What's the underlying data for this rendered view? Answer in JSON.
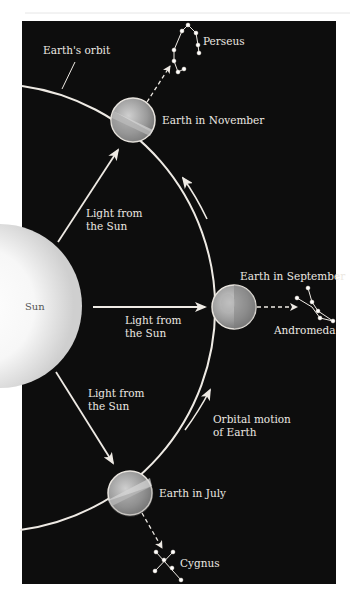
{
  "diagram": {
    "background_color": "#0d0d0d",
    "line_color": "#eeeae4",
    "labels": {
      "earths_orbit": "Earth's orbit",
      "sun": "Sun",
      "perseus": "Perseus",
      "andromeda": "Andromeda",
      "cygnus": "Cygnus",
      "earth_november": "Earth in November",
      "earth_september": "Earth in September",
      "earth_july": "Earth in July",
      "light_upper_1": "Light from",
      "light_upper_2": "the Sun",
      "light_middle_1": "Light from",
      "light_middle_2": "the Sun",
      "light_lower_1": "Light from",
      "light_lower_2": "the Sun",
      "orbital_motion_1": "Orbital motion",
      "orbital_motion_2": "of Earth"
    },
    "earths": [
      {
        "name": "November",
        "cx": 133,
        "cy": 120,
        "r": 22
      },
      {
        "name": "September",
        "cx": 234,
        "cy": 307,
        "r": 22
      },
      {
        "name": "July",
        "cx": 130,
        "cy": 493,
        "r": 22
      }
    ],
    "constellations": {
      "perseus": [
        [
          184,
          69
        ],
        [
          178,
          72
        ],
        [
          174,
          61
        ],
        [
          174,
          50
        ],
        [
          182,
          31
        ],
        [
          188,
          25
        ],
        [
          196,
          33
        ],
        [
          198,
          45
        ],
        [
          199,
          53
        ]
      ],
      "andromeda": [
        [
          297,
          298
        ],
        [
          308,
          288
        ],
        [
          312,
          302
        ],
        [
          318,
          311
        ],
        [
          320,
          318
        ],
        [
          333,
          321
        ]
      ],
      "cygnus": [
        [
          156,
          552
        ],
        [
          173,
          552
        ],
        [
          164,
          560
        ],
        [
          155,
          571
        ],
        [
          172,
          568
        ],
        [
          181,
          580
        ]
      ]
    }
  }
}
